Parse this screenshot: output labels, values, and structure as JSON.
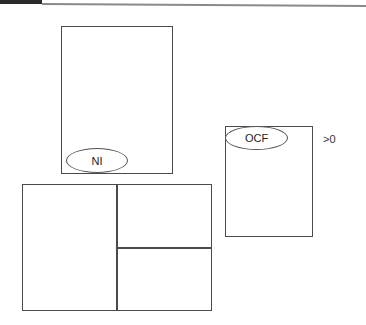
{
  "diagram": {
    "nodes": [
      {
        "id": "ni-box",
        "label": "NI",
        "shape": "rectangle-with-ellipse-label"
      },
      {
        "id": "ocf-box",
        "label": "OCF",
        "shape": "rectangle-with-ellipse-label",
        "annotation": ">0"
      },
      {
        "id": "split-box",
        "label": "",
        "shape": "rectangle-split",
        "sections": 3
      }
    ],
    "labels": {
      "ni": "NI",
      "ocf": "OCF",
      "ocf_annotation": ">0"
    },
    "colors": {
      "stroke": "#4a4a4a",
      "background": "#ffffff",
      "topbar": "#2a2a2a"
    }
  }
}
